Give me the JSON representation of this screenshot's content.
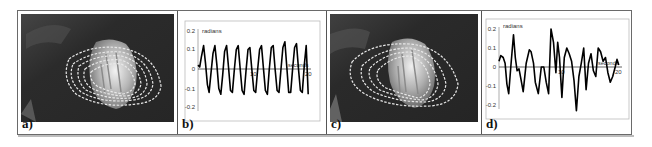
{
  "figure": {
    "panels": [
      {
        "id": "a",
        "label": "a)",
        "type": "image",
        "description": "Grayscale photo of object with multiple white dashed contour outlines"
      },
      {
        "id": "b",
        "label": "b)",
        "type": "chart"
      },
      {
        "id": "c",
        "label": "c)",
        "type": "image",
        "description": "Grayscale photo of object with multiple white dashed contour outlines"
      },
      {
        "id": "d",
        "label": "d)",
        "type": "chart"
      }
    ]
  },
  "chart_data": [
    {
      "panel": "b",
      "type": "line",
      "title": "",
      "ylabel": "radians",
      "xlabel": "seconds",
      "ylim": [
        -0.2,
        0.2
      ],
      "xlim": [
        0,
        20
      ],
      "yticks": [
        "0.2",
        "0.1",
        "0",
        "-0.1",
        "-0.2"
      ],
      "xticks": [
        "10",
        "20"
      ],
      "grid": false,
      "description": "Regular sinusoidal oscillation, amplitude ~0.12-0.14 rad, ~15 cycles over 20 s",
      "x": [
        0,
        0.3,
        0.6,
        1.0,
        1.35,
        1.7,
        2.0,
        2.35,
        2.7,
        3.05,
        3.4,
        3.75,
        4.1,
        4.45,
        4.8,
        5.15,
        5.5,
        5.85,
        6.2,
        6.55,
        6.9,
        7.25,
        7.6,
        7.95,
        8.3,
        8.65,
        9.0,
        9.35,
        9.7,
        10.05,
        10.4,
        10.75,
        11.1,
        11.45,
        11.8,
        12.15,
        12.5,
        12.85,
        13.2,
        13.55,
        13.9,
        14.25,
        14.6,
        14.95,
        15.3,
        15.65,
        16.0,
        16.35,
        16.7,
        17.05,
        17.4,
        17.75,
        18.1,
        18.45,
        18.8,
        19.15,
        19.5,
        19.85
      ],
      "values": [
        0.02,
        0.01,
        0.06,
        0.12,
        0.03,
        -0.08,
        -0.12,
        -0.02,
        0.08,
        0.12,
        0.02,
        -0.1,
        -0.13,
        -0.03,
        0.09,
        0.12,
        0.01,
        -0.11,
        -0.12,
        0.0,
        0.1,
        0.12,
        0.0,
        -0.11,
        -0.13,
        -0.01,
        0.1,
        0.11,
        0.0,
        -0.11,
        -0.12,
        0.0,
        0.1,
        0.12,
        0.0,
        -0.11,
        -0.13,
        0.0,
        0.11,
        0.12,
        0.0,
        -0.11,
        -0.12,
        0.0,
        0.11,
        0.14,
        0.01,
        -0.12,
        -0.12,
        0.0,
        0.11,
        0.13,
        0.0,
        -0.11,
        -0.12,
        0.02,
        0.12,
        -0.13
      ]
    },
    {
      "panel": "d",
      "type": "line",
      "title": "",
      "ylabel": "radians",
      "xlabel": "seconds",
      "ylim": [
        -0.2,
        0.2
      ],
      "xlim": [
        0,
        20
      ],
      "yticks": [
        "0.2",
        "0.1",
        "0",
        "-0.1",
        "-0.2"
      ],
      "xticks": [
        "10",
        "20"
      ],
      "grid": false,
      "description": "Irregular oscillation with amplitude up to ~0.2 rad",
      "x": [
        0,
        0.3,
        0.7,
        1.0,
        1.3,
        1.6,
        2.0,
        2.4,
        2.7,
        3.0,
        3.3,
        3.6,
        4.0,
        4.5,
        5.0,
        5.3,
        5.7,
        6.0,
        6.5,
        7.0,
        7.4,
        7.8,
        8.2,
        8.6,
        9.0,
        9.4,
        9.7,
        10.0,
        10.4,
        10.8,
        11.2,
        11.6,
        12.0,
        12.4,
        12.8,
        13.2,
        13.6,
        14.0,
        14.4,
        14.8,
        15.2,
        15.6,
        16.0,
        16.4,
        16.8,
        17.2,
        17.6,
        18.0,
        18.4,
        18.8,
        19.2,
        19.5,
        19.8
      ],
      "values": [
        0.03,
        0.06,
        0.05,
        0.02,
        -0.09,
        -0.14,
        0.02,
        0.17,
        0.05,
        -0.02,
        -0.01,
        -0.06,
        -0.13,
        0.02,
        0.09,
        0.08,
        0.02,
        -0.08,
        -0.14,
        0.0,
        0.0,
        -0.08,
        -0.14,
        0.2,
        0.13,
        -0.03,
        0.13,
        0.05,
        -0.16,
        0.05,
        0.1,
        0.07,
        0.03,
        -0.07,
        -0.23,
        -0.05,
        0.02,
        0.1,
        -0.12,
        0.02,
        0.07,
        -0.02,
        -0.05,
        0.1,
        0.08,
        0.03,
        0.05,
        -0.03,
        -0.08,
        -0.05,
        0.0,
        0.04,
        0.01
      ]
    }
  ]
}
